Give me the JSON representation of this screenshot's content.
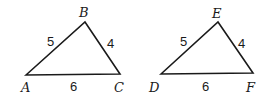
{
  "diagram": {
    "triangles": [
      {
        "name": "triangle-ABC",
        "vertices": [
          {
            "label": "A",
            "x": 26,
            "y": 75,
            "lx": 21,
            "ly": 92
          },
          {
            "label": "B",
            "x": 85,
            "y": 22,
            "lx": 79,
            "ly": 17
          },
          {
            "label": "C",
            "x": 120,
            "y": 74,
            "lx": 114,
            "ly": 92
          }
        ],
        "sides": [
          {
            "label": "5",
            "between": "AB",
            "lx": 47,
            "ly": 46
          },
          {
            "label": "4",
            "between": "BC",
            "lx": 107,
            "ly": 48
          },
          {
            "label": "6",
            "between": "AC",
            "lx": 70,
            "ly": 91
          }
        ]
      },
      {
        "name": "triangle-DEF",
        "vertices": [
          {
            "label": "D",
            "x": 161,
            "y": 74,
            "lx": 149,
            "ly": 92
          },
          {
            "label": "E",
            "x": 218,
            "y": 22,
            "lx": 212,
            "ly": 18
          },
          {
            "label": "F",
            "x": 253,
            "y": 73,
            "lx": 246,
            "ly": 92
          }
        ],
        "sides": [
          {
            "label": "5",
            "between": "DE",
            "lx": 180,
            "ly": 46
          },
          {
            "label": "4",
            "between": "EF",
            "lx": 238,
            "ly": 48
          },
          {
            "label": "6",
            "between": "DF",
            "lx": 202,
            "ly": 91
          }
        ]
      }
    ]
  }
}
